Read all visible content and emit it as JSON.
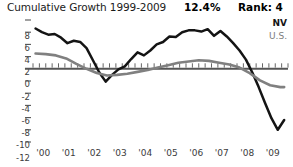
{
  "header": {
    "title": "Cumulative Growth 1999-2009",
    "value": "12.4%",
    "rank": "Rank: 4"
  },
  "legend": {
    "position": "top-right",
    "entries": [
      {
        "label": "NV",
        "color": "#141414"
      },
      {
        "label": "U.S.",
        "color": "#7d7d7d"
      }
    ]
  },
  "colors": {
    "series_nv": "#141414",
    "series_us": "#808080",
    "axis": "#555555",
    "text": "#3c3c3c",
    "background": "#ffffff"
  },
  "chart_data": {
    "type": "line",
    "title": "Cumulative Growth 1999-2009",
    "xlabel": "",
    "ylabel": "",
    "grid": false,
    "legend_position": "top-right",
    "ylim": [
      -12,
      8
    ],
    "xlim": [
      1999.6,
      2009.6
    ],
    "yticks": [
      "8",
      "6",
      "4",
      "2",
      "0",
      "-2",
      "-4",
      "-6",
      "-8",
      "-10",
      "-12"
    ],
    "ytick_values": [
      8,
      6,
      4,
      2,
      0,
      -2,
      -4,
      -6,
      -8,
      -10,
      -12
    ],
    "categories": [
      "'00",
      "'01",
      "'02",
      "'03",
      "'04",
      "'05",
      "'06",
      "'07",
      "'08",
      "'09"
    ],
    "xtick_values": [
      2000,
      2001,
      2002,
      2003,
      2004,
      2005,
      2006,
      2007,
      2008,
      2009
    ],
    "series": [
      {
        "name": "NV",
        "color": "#141414",
        "x": [
          1999.7,
          1999.95,
          2000.2,
          2000.45,
          2000.7,
          2000.95,
          2001.2,
          2001.45,
          2001.7,
          2001.95,
          2002.2,
          2002.45,
          2002.7,
          2002.95,
          2003.2,
          2003.45,
          2003.7,
          2003.95,
          2004.2,
          2004.45,
          2004.7,
          2004.95,
          2005.2,
          2005.45,
          2005.7,
          2005.95,
          2006.2,
          2006.45,
          2006.7,
          2006.95,
          2007.2,
          2007.45,
          2007.7,
          2007.95,
          2008.2,
          2008.45,
          2008.7,
          2008.95,
          2009.2,
          2009.45
        ],
        "y": [
          6.6,
          6.0,
          5.6,
          5.7,
          5.1,
          4.2,
          4.6,
          4.4,
          3.4,
          1.4,
          -0.6,
          -2.1,
          -1.0,
          -0.1,
          0.4,
          1.6,
          2.7,
          2.2,
          3.0,
          4.0,
          4.4,
          5.3,
          5.2,
          6.0,
          6.3,
          6.3,
          6.1,
          6.5,
          5.4,
          6.2,
          5.3,
          4.2,
          3.0,
          1.5,
          -0.6,
          -3.0,
          -5.6,
          -8.1,
          -10.0,
          -8.4
        ]
      },
      {
        "name": "U.S.",
        "color": "#808080",
        "x": [
          1999.7,
          2000.1,
          2000.5,
          2000.9,
          2001.3,
          2001.7,
          2002.1,
          2002.5,
          2002.9,
          2003.3,
          2003.7,
          2004.1,
          2004.5,
          2004.9,
          2005.3,
          2005.7,
          2006.1,
          2006.5,
          2006.9,
          2007.3,
          2007.7,
          2008.1,
          2008.5,
          2008.9,
          2009.3,
          2009.45
        ],
        "y": [
          2.5,
          2.4,
          2.2,
          1.7,
          0.8,
          0.0,
          -0.7,
          -1.1,
          -1.0,
          -0.8,
          -0.5,
          -0.2,
          0.2,
          0.6,
          1.0,
          1.2,
          1.4,
          1.3,
          1.0,
          0.7,
          0.2,
          -0.7,
          -1.9,
          -2.7,
          -3.0,
          -3.0
        ]
      }
    ],
    "annotations": [
      {
        "text": "12.4%",
        "role": "cumulative-growth-value"
      },
      {
        "text": "Rank: 4",
        "role": "rank-value"
      }
    ]
  }
}
